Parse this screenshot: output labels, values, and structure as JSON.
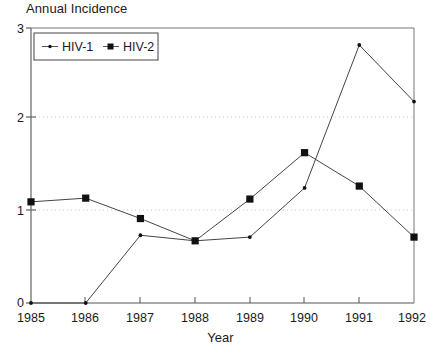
{
  "chart_data": {
    "type": "line",
    "title": "Annual Incidence",
    "xlabel": "Year",
    "ylabel": "",
    "x": [
      1985,
      1986,
      1987,
      1988,
      1989,
      1990,
      1991,
      1992
    ],
    "xtick_labels": [
      "1985",
      "1986",
      "1987",
      "1988",
      "1989",
      "1990",
      "1991",
      "1992"
    ],
    "ytick_labels": [
      "0",
      "1",
      "2",
      "3"
    ],
    "ytick_values": [
      0,
      1,
      2,
      3
    ],
    "ylim": [
      0,
      3
    ],
    "xlim": [
      1985,
      1992
    ],
    "grid": "horizontal dotted gridlines at y=1 and y=2",
    "legend_position": "top-left inside plot area",
    "series": [
      {
        "name": "HIV-1",
        "marker": "small-dot",
        "values": [
          0,
          0,
          0.73,
          0.67,
          0.71,
          1.24,
          2.78,
          2.17
        ]
      },
      {
        "name": "HIV-2",
        "marker": "filled-square",
        "values": [
          1.09,
          1.13,
          0.91,
          0.67,
          1.12,
          1.62,
          1.26,
          0.71
        ]
      }
    ],
    "colors": {
      "axis": "#555555",
      "series_line": "#444444",
      "marker": "#111111",
      "gridline": "#cccccc",
      "background": "#ffffff"
    }
  },
  "legend": {
    "entries": [
      {
        "label": "HIV-1"
      },
      {
        "label": "HIV-2"
      }
    ]
  }
}
